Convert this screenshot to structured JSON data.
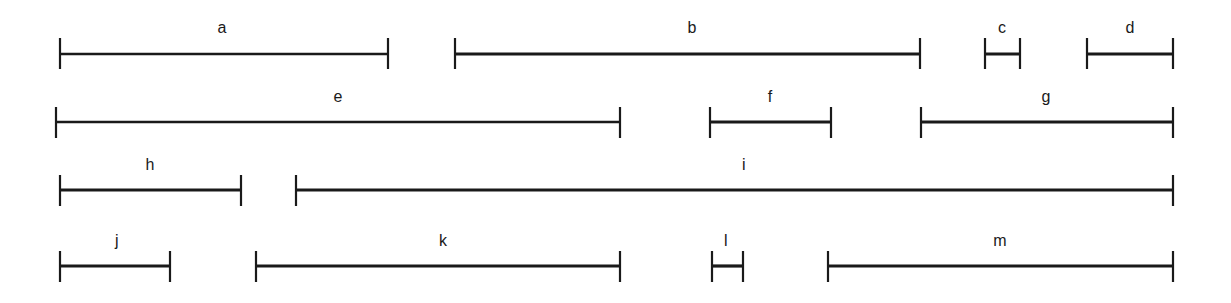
{
  "figure": {
    "background_color": "#ffffff",
    "line_color": "#1a1a1a",
    "label_color": "#1a1a1a",
    "width": 1231,
    "height": 303
  },
  "chart_data": {
    "type": "bar",
    "orientation": "horizontal",
    "title": "",
    "subtitle": "",
    "xlabel": "",
    "ylabel": "",
    "xlim": [
      0,
      1231
    ],
    "grid": false,
    "legend": null,
    "axis_visible": false,
    "note": "Horizontal capped segments (I-beam / range bars) arranged on four rows; each segment is labeled with a letter centered above it. Values are pixel extents read off the image.",
    "categories": [
      "a",
      "b",
      "c",
      "d",
      "e",
      "f",
      "g",
      "h",
      "i",
      "j",
      "k",
      "l",
      "m"
    ],
    "values": [
      328,
      465,
      35,
      86,
      565,
      121,
      252,
      181,
      877,
      110,
      364,
      31,
      344
    ],
    "rows": [
      {
        "row": 1,
        "line_y": 54,
        "cap_top": 38,
        "cap_bottom": 69,
        "label_y": 28,
        "segments": [
          {
            "label": "a",
            "x1": 60,
            "x2": 388,
            "length": 328,
            "label_x": 222,
            "line_weight": 2.6
          },
          {
            "label": "b",
            "x1": 455,
            "x2": 920,
            "length": 465,
            "label_x": 692,
            "line_weight": 2.8
          },
          {
            "label": "c",
            "x1": 985,
            "x2": 1020,
            "length": 35,
            "label_x": 1002,
            "line_weight": 3.0
          },
          {
            "label": "d",
            "x1": 1087,
            "x2": 1173,
            "length": 86,
            "label_x": 1130,
            "line_weight": 3.2
          }
        ]
      },
      {
        "row": 2,
        "line_y": 122,
        "cap_top": 107,
        "cap_bottom": 138,
        "label_y": 97,
        "segments": [
          {
            "label": "e",
            "x1": 56,
            "x2": 620,
            "length": 565,
            "label_x": 338,
            "line_weight": 2.6
          },
          {
            "label": "f",
            "x1": 710,
            "x2": 831,
            "length": 121,
            "label_x": 770,
            "line_weight": 3.0
          },
          {
            "label": "g",
            "x1": 921,
            "x2": 1173,
            "length": 252,
            "label_x": 1046,
            "line_weight": 2.8
          }
        ]
      },
      {
        "row": 3,
        "line_y": 190,
        "cap_top": 175,
        "cap_bottom": 206,
        "label_y": 165,
        "segments": [
          {
            "label": "h",
            "x1": 60,
            "x2": 241,
            "length": 181,
            "label_x": 150,
            "line_weight": 3.0
          },
          {
            "label": "i",
            "x1": 296,
            "x2": 1173,
            "length": 877,
            "label_x": 744,
            "line_weight": 3.2
          }
        ]
      },
      {
        "row": 4,
        "line_y": 266,
        "cap_top": 251,
        "cap_bottom": 282,
        "label_y": 241,
        "segments": [
          {
            "label": "j",
            "x1": 60,
            "x2": 170,
            "length": 110,
            "label_x": 117,
            "line_weight": 3.0
          },
          {
            "label": "k",
            "x1": 256,
            "x2": 620,
            "length": 364,
            "label_x": 443,
            "line_weight": 2.8
          },
          {
            "label": "l",
            "x1": 712,
            "x2": 743,
            "length": 31,
            "label_x": 726,
            "line_weight": 3.2
          },
          {
            "label": "m",
            "x1": 828,
            "x2": 1173,
            "length": 344,
            "label_x": 1000,
            "line_weight": 2.8
          }
        ]
      }
    ]
  }
}
